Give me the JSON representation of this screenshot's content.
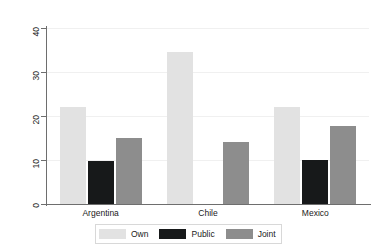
{
  "chart_data": {
    "type": "bar",
    "title": "",
    "xlabel": "",
    "ylabel": "Thousands of 2002 US$",
    "categories": [
      "Argentina",
      "Chile",
      "Mexico"
    ],
    "series": [
      {
        "name": "Own",
        "color": "#e2e2e2",
        "values": [
          22.0,
          34.5,
          22.0
        ]
      },
      {
        "name": "Public",
        "color": "#17191a",
        "values": [
          9.8,
          null,
          10.1
        ]
      },
      {
        "name": "Joint",
        "color": "#8d8d8d",
        "values": [
          15.0,
          14.0,
          17.8
        ]
      }
    ],
    "ylim": [
      0,
      40
    ],
    "yticks": [
      0,
      10,
      20,
      30,
      40
    ],
    "ytick_labels": [
      "0",
      "10",
      "20",
      "30",
      "40"
    ],
    "grid": true,
    "legend_position": "bottom"
  }
}
